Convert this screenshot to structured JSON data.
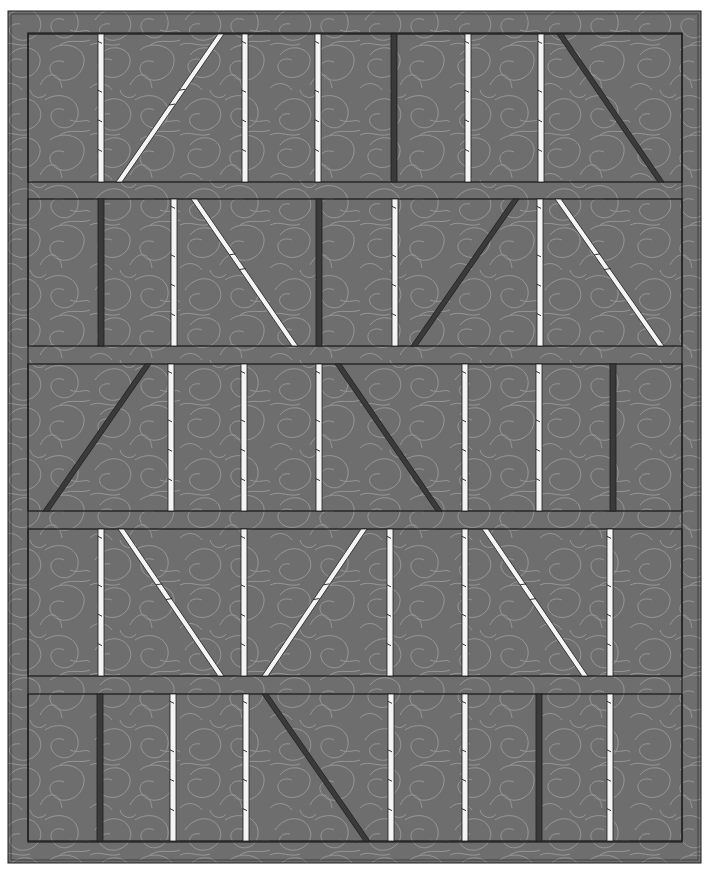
{
  "canvas": {
    "width": 708,
    "height": 874,
    "background": "#ffffff"
  },
  "colors": {
    "fabric": "#6e6e6e",
    "fabric_dark_tone": "#5f5f5f",
    "stitch": "#a8a8a8",
    "seam": "#1e1e1e",
    "strip_light": "#f4f4f4",
    "strip_dark": "#3a3a3a"
  },
  "quilt": {
    "outer": {
      "x1": 8,
      "y1": 11,
      "x2": 701,
      "y2": 863
    },
    "outer_inner_line": {
      "x1": 11,
      "y1": 14,
      "x2": 698,
      "y2": 860
    },
    "field": {
      "x1": 28,
      "y1": 33,
      "x2": 682,
      "y2": 842
    },
    "rows": [
      {
        "y1": 34,
        "y2": 182,
        "strips": [
          {
            "type": "vertical",
            "tone": "light",
            "x": 101
          },
          {
            "type": "diagonal",
            "tone": "light",
            "x_top": 221,
            "x_bottom": 119
          },
          {
            "type": "vertical",
            "tone": "light",
            "x": 245
          },
          {
            "type": "vertical",
            "tone": "light",
            "x": 318
          },
          {
            "type": "vertical",
            "tone": "dark",
            "x": 394
          },
          {
            "type": "vertical",
            "tone": "light",
            "x": 468
          },
          {
            "type": "vertical",
            "tone": "light",
            "x": 541
          },
          {
            "type": "diagonal",
            "tone": "dark",
            "x_top": 560,
            "x_bottom": 661
          }
        ]
      },
      {
        "y1": 199,
        "y2": 346,
        "strips": [
          {
            "type": "vertical",
            "tone": "dark",
            "x": 101
          },
          {
            "type": "vertical",
            "tone": "light",
            "x": 174
          },
          {
            "type": "diagonal",
            "tone": "light",
            "x_top": 194,
            "x_bottom": 295
          },
          {
            "type": "vertical",
            "tone": "dark",
            "x": 319
          },
          {
            "type": "vertical",
            "tone": "light",
            "x": 395
          },
          {
            "type": "diagonal",
            "tone": "dark",
            "x_top": 516,
            "x_bottom": 414
          },
          {
            "type": "vertical",
            "tone": "light",
            "x": 540
          },
          {
            "type": "diagonal",
            "tone": "light",
            "x_top": 558,
            "x_bottom": 661
          }
        ]
      },
      {
        "y1": 364,
        "y2": 511,
        "strips": [
          {
            "type": "diagonal",
            "tone": "dark",
            "x_top": 148,
            "x_bottom": 46
          },
          {
            "type": "vertical",
            "tone": "light",
            "x": 171
          },
          {
            "type": "vertical",
            "tone": "light",
            "x": 244
          },
          {
            "type": "vertical",
            "tone": "light",
            "x": 319
          },
          {
            "type": "diagonal",
            "tone": "dark",
            "x_top": 338,
            "x_bottom": 439
          },
          {
            "type": "vertical",
            "tone": "light",
            "x": 465
          },
          {
            "type": "vertical",
            "tone": "light",
            "x": 539
          },
          {
            "type": "vertical",
            "tone": "dark",
            "x": 613
          }
        ]
      },
      {
        "y1": 529,
        "y2": 676,
        "strips": [
          {
            "type": "vertical",
            "tone": "light",
            "x": 101
          },
          {
            "type": "diagonal",
            "tone": "light",
            "x_top": 121,
            "x_bottom": 221
          },
          {
            "type": "vertical",
            "tone": "light",
            "x": 244
          },
          {
            "type": "diagonal",
            "tone": "light",
            "x_top": 364,
            "x_bottom": 265
          },
          {
            "type": "vertical",
            "tone": "light",
            "x": 390
          },
          {
            "type": "vertical",
            "tone": "light",
            "x": 465
          },
          {
            "type": "diagonal",
            "tone": "light",
            "x_top": 485,
            "x_bottom": 585
          },
          {
            "type": "vertical",
            "tone": "light",
            "x": 610
          }
        ]
      },
      {
        "y1": 694,
        "y2": 841,
        "strips": [
          {
            "type": "vertical",
            "tone": "dark",
            "x": 100
          },
          {
            "type": "vertical",
            "tone": "light",
            "x": 173
          },
          {
            "type": "vertical",
            "tone": "light",
            "x": 246
          },
          {
            "type": "diagonal",
            "tone": "dark",
            "x_top": 265,
            "x_bottom": 367
          },
          {
            "type": "vertical",
            "tone": "light",
            "x": 391
          },
          {
            "type": "vertical",
            "tone": "light",
            "x": 465
          },
          {
            "type": "vertical",
            "tone": "dark",
            "x": 539
          },
          {
            "type": "vertical",
            "tone": "light",
            "x": 610
          }
        ]
      }
    ],
    "strip_width": 6,
    "sashing_count": 4
  }
}
